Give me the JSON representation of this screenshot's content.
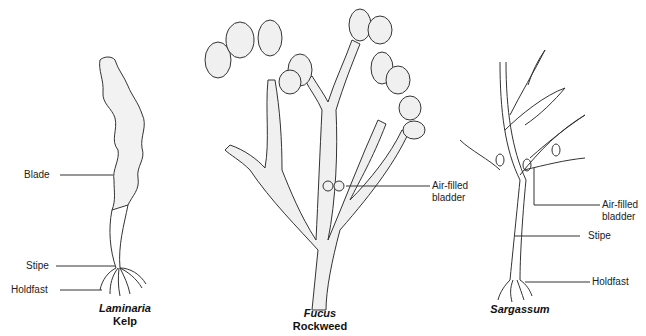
{
  "diagram": {
    "kelp": {
      "genus": "Laminaria",
      "common_name": "Kelp",
      "labels": {
        "blade": "Blade",
        "stipe": "Stipe",
        "holdfast": "Holdfast"
      }
    },
    "rockweed": {
      "genus": "Fucus",
      "common_name": "Rockweed",
      "labels": {
        "bladder_line1": "Air-filled",
        "bladder_line2": "bladder"
      }
    },
    "sargassum": {
      "genus": "Sargassum",
      "labels": {
        "bladder_line1": "Air-filled",
        "bladder_line2": "bladder",
        "stipe": "Stipe",
        "holdfast": "Holdfast"
      }
    }
  }
}
